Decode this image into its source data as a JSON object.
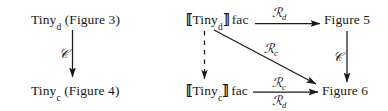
{
  "figure": {
    "kind": "commutative-diagram",
    "background_color": "#ffffff",
    "ink_color": "#1a1a1a",
    "panels": [
      {
        "id": "left-panel",
        "name": "tiny-semantics-panel",
        "nodes": [
          {
            "id": "tiny-d",
            "text_prefix": "Tiny",
            "subscript": "d",
            "text_suffix": " (Figure 3)"
          },
          {
            "id": "tiny-c",
            "text_prefix": "Tiny",
            "subscript": "c",
            "text_suffix": " (Figure 4)"
          }
        ],
        "edges": [
          {
            "id": "left-vertical",
            "from": "tiny-d",
            "to": "tiny-c",
            "label": "C",
            "style": "solid",
            "direction": "down"
          }
        ]
      },
      {
        "id": "right-panel",
        "name": "denotation-square-panel",
        "nodes": [
          {
            "id": "sem-tiny-d",
            "open_bracket": "⟦",
            "text_prefix": "Tiny",
            "subscript": "d",
            "close_bracket": "⟧",
            "text_suffix": "fac"
          },
          {
            "id": "sem-tiny-c",
            "open_bracket": "⟦",
            "text_prefix": "Tiny",
            "subscript": "c",
            "close_bracket": "⟧",
            "text_suffix": "fac"
          },
          {
            "id": "figure-5",
            "text": "Figure 5"
          },
          {
            "id": "figure-6",
            "text": "Figure 6"
          }
        ],
        "edges": [
          {
            "id": "top-horizontal",
            "from": "sem-tiny-d",
            "to": "figure-5",
            "label_main": "R",
            "label_sub": "d",
            "style": "solid",
            "direction": "right"
          },
          {
            "id": "left-vertical-dashed",
            "from": "sem-tiny-d",
            "to": "sem-tiny-c",
            "label": "",
            "style": "dashed",
            "direction": "down"
          },
          {
            "id": "diagonal",
            "from": "sem-tiny-d",
            "to": "figure-6",
            "label_main": "R",
            "label_sub": "c",
            "style": "solid",
            "direction": "down-right"
          },
          {
            "id": "bottom-horizontal-upper",
            "from": "sem-tiny-c",
            "to": "figure-6",
            "label_main": "R",
            "label_sub": "c",
            "style": "solid",
            "direction": "right"
          },
          {
            "id": "bottom-horizontal-lower",
            "from": "sem-tiny-c",
            "to": "figure-6",
            "label_main": "R",
            "label_sub": "d",
            "style": "solid",
            "direction": "right"
          },
          {
            "id": "right-vertical",
            "from": "figure-5",
            "to": "figure-6",
            "label": "C",
            "style": "solid",
            "direction": "down"
          }
        ]
      }
    ]
  },
  "labels": {
    "tiny_d_left": {
      "base": "Tiny",
      "sub": "d",
      "tail": "(Figure 3)"
    },
    "tiny_c_left": {
      "base": "Tiny",
      "sub": "c",
      "tail": "(Figure 4)"
    },
    "sem_tiny_d": {
      "open": "⟦",
      "base": "Tiny",
      "sub": "d",
      "close": "⟧",
      "tail": "fac"
    },
    "sem_tiny_c": {
      "open": "⟦",
      "base": "Tiny",
      "sub": "c",
      "close": "⟧",
      "tail": "fac"
    },
    "figure5": "Figure 5",
    "figure6": "Figure 6",
    "script_c_left": "𝒞",
    "script_c_right": "𝒞",
    "r_d_top": {
      "main": "ℛ",
      "sub": "d"
    },
    "r_c_diagonal": {
      "main": "ℛ",
      "sub": "c"
    },
    "r_c_bottom": {
      "main": "ℛ",
      "sub": "c"
    },
    "r_d_bottom": {
      "main": "ℛ",
      "sub": "d"
    }
  }
}
